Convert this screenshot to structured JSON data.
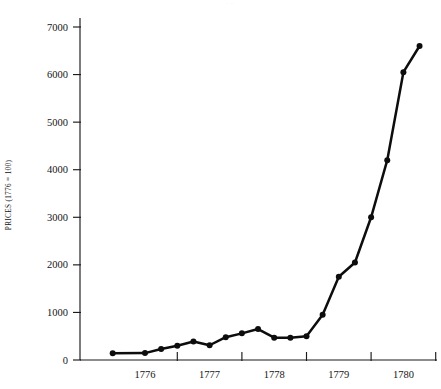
{
  "chart_data": {
    "type": "line",
    "title": "",
    "xlabel": "",
    "ylabel": "PRICES (1776 = 100)",
    "ylim": [
      0,
      7400
    ],
    "xlim": [
      1775.5,
      1781.1
    ],
    "yticks": [
      0,
      1000,
      2000,
      3000,
      4000,
      5000,
      6000,
      7000
    ],
    "ytick_labels": [
      "0",
      "1000",
      "2000",
      "3000",
      "4000",
      "5000",
      "6000",
      "7000"
    ],
    "xticks": [
      1776,
      1777,
      1778,
      1779,
      1780
    ],
    "xtick_labels": [
      "1776",
      "1777",
      "1778",
      "1779",
      "1780"
    ],
    "grid": false,
    "legend": false,
    "legend_position": "none",
    "marker": "filled-circle",
    "line_color": "#0d0d0d",
    "series": [
      {
        "name": "Prices (1776 = 100)",
        "x": [
          1775.5,
          1776.0,
          1776.25,
          1776.5,
          1776.75,
          1777.0,
          1777.25,
          1777.5,
          1777.75,
          1778.0,
          1778.25,
          1778.5,
          1778.75,
          1779.0,
          1779.25,
          1779.5,
          1779.75,
          1780.0,
          1780.25
        ],
        "values": [
          140,
          145,
          230,
          300,
          390,
          310,
          480,
          560,
          650,
          470,
          470,
          500,
          950,
          1750,
          2050,
          3000,
          4200,
          6050,
          6600
        ]
      }
    ],
    "annotations": []
  },
  "axis": {
    "ytitle": "PRICES (1776 = 100)"
  },
  "title_remnant": {
    "text": "· ··"
  }
}
